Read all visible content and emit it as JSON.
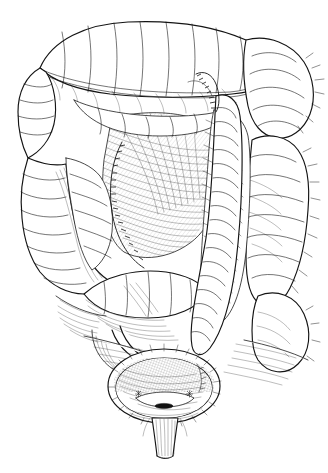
{
  "figure": {
    "medium": "black ink line engraving on white",
    "background_color": "#ffffff",
    "ink_color": "#141414",
    "width": 328,
    "height": 473,
    "caption_text": "",
    "caption_state": "clipped at lower image edge, illegible"
  },
  "structures": [
    {
      "id": "transverse-colon",
      "label": "Transverse colon"
    },
    {
      "id": "splenic-flexure",
      "label": "Left colic (splenic) flexure"
    },
    {
      "id": "descending-colon",
      "label": "Descending colon"
    },
    {
      "id": "hepatic-flexure",
      "label": "Right colic (hepatic) flexure"
    },
    {
      "id": "ascending-colon",
      "label": "Ascending colon"
    },
    {
      "id": "cecum",
      "label": "Cecum"
    },
    {
      "id": "sigmoid-colon",
      "label": "Sigmoid colon"
    },
    {
      "id": "mesentery",
      "label": "Mesentery"
    },
    {
      "id": "urinary-bladder",
      "label": "Urinary bladder, opened"
    },
    {
      "id": "bladder-trigone",
      "label": "Trigone of bladder"
    },
    {
      "id": "ureteric-orifices",
      "label": "Ureteric orifices",
      "count": 2
    },
    {
      "id": "urethra",
      "label": "Urethra"
    }
  ]
}
